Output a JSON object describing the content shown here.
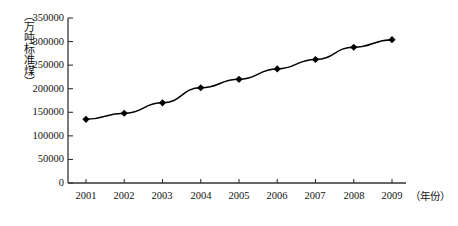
{
  "chart_data": {
    "type": "line",
    "title": "",
    "subtitle": "",
    "xlabel": "（年份）",
    "ylabel": "（万吨标准煤）",
    "categories": [
      "2001",
      "2002",
      "2003",
      "2004",
      "2005",
      "2006",
      "2007",
      "2008",
      "2009"
    ],
    "x": [
      2001,
      2002,
      2003,
      2004,
      2005,
      2006,
      2007,
      2008,
      2009
    ],
    "values": [
      135000,
      148000,
      170000,
      202000,
      220000,
      242000,
      262000,
      288000,
      304000
    ],
    "series": [
      {
        "name": "能源消费总量",
        "values": [
          135000,
          148000,
          170000,
          202000,
          220000,
          242000,
          262000,
          288000,
          304000
        ]
      }
    ],
    "ylim": [
      0,
      350000
    ],
    "ytick_step": 50000,
    "ytick_labels": [
      "0",
      "50000",
      "100000",
      "150000",
      "200000",
      "250000",
      "300000",
      "350000"
    ],
    "ytick_values": [
      0,
      50000,
      100000,
      150000,
      200000,
      250000,
      300000,
      350000
    ],
    "xtick_labels": [
      "2001",
      "2002",
      "2003",
      "2004",
      "2005",
      "2006",
      "2007",
      "2008",
      "2009"
    ],
    "grid": false,
    "legend": false,
    "legend_position": "none",
    "marker": "diamond",
    "line_color": "#000000",
    "marker_color": "#000000",
    "background_color": "#ffffff",
    "axis_color": "#333333"
  },
  "axes": {
    "y_title": "（万吨标准煤）",
    "x_title": "（年份）"
  }
}
